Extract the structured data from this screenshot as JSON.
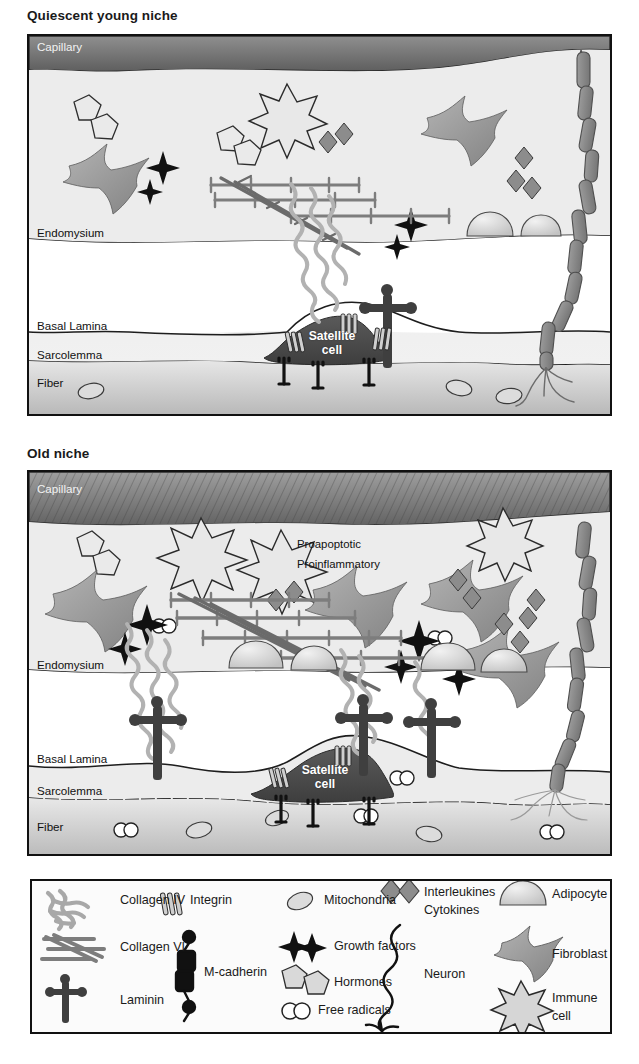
{
  "figure": {
    "type": "biological-schematic"
  },
  "panels": [
    {
      "id": "quiescent-young-niche",
      "title": "Quiescent young niche",
      "zone_labels": [
        "Capillary",
        "Endomysium",
        "Basal Lamina",
        "Sarcolemma",
        "Fiber"
      ],
      "cell_label_line1": "Satellite",
      "cell_label_line2": "cell",
      "annotations": []
    },
    {
      "id": "old-niche",
      "title": "Old niche",
      "zone_labels": [
        "Capillary",
        "Endomysium",
        "Basal Lamina",
        "Sarcolemma",
        "Fiber"
      ],
      "cell_label_line1": "Satellite",
      "cell_label_line2": "cell",
      "annotations": [
        "Proapoptotic",
        "Proinflammatory"
      ]
    }
  ],
  "legend": {
    "columns": [
      {
        "items": [
          {
            "icon": "collagen-iv-icon",
            "label": "Collagen IV"
          },
          {
            "icon": "collagen-vi-icon",
            "label": "Collagen VI"
          },
          {
            "icon": "laminin-icon",
            "label": "Laminin"
          }
        ]
      },
      {
        "items": [
          {
            "icon": "integrin-icon",
            "label": "Integrin"
          },
          {
            "icon": "m-cadherin-icon",
            "label": "M-cadherin"
          }
        ]
      },
      {
        "items": [
          {
            "icon": "mitochondria-icon",
            "label": "Mitochondria"
          },
          {
            "icon": "growth-factors-icon",
            "label": "Growth factors"
          },
          {
            "icon": "hormones-icon",
            "label": "Hormones"
          },
          {
            "icon": "free-radicals-icon",
            "label": "Free radicals"
          }
        ]
      },
      {
        "items": [
          {
            "icon": "interleukines-icon",
            "label": "Interleukines"
          },
          {
            "icon": "cytokines-icon",
            "label": "Cytokines"
          },
          {
            "icon": "neuron-icon",
            "label": "Neuron"
          }
        ]
      },
      {
        "items": [
          {
            "icon": "adipocyte-icon",
            "label": "Adipocyte"
          },
          {
            "icon": "fibroblast-icon",
            "label": "Fibroblast"
          },
          {
            "icon": "immune-cell-icon",
            "label": "Immune"
          },
          {
            "icon": "immune-cell-icon-2",
            "label": "cell"
          }
        ]
      }
    ]
  },
  "colors": {
    "capillary": "#6e6e6e",
    "interstitium": "#e9e9e9",
    "fiber": "#c9c9c9",
    "satellite_cell": "#4c4c4c",
    "collagen_iv": "#a8a8a8",
    "collagen_vi": "#7d7d7d",
    "laminin": "#3f3f3f",
    "neuron": "#8a8a8a",
    "adipocyte": "#d3d3d3",
    "fibroblast": "#999999",
    "immune_cell": "#d0d0d0",
    "outline": "#111111"
  }
}
